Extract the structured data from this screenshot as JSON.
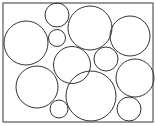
{
  "diagram": {
    "type": "circle-packing",
    "frame": {
      "x": 3,
      "y": 3,
      "width": 150,
      "height": 119,
      "stroke": "#666666"
    },
    "stroke_color": "#333333",
    "fill_color": "#ffffff",
    "circles": [
      {
        "cx": 57,
        "cy": 15,
        "r": 12
      },
      {
        "cx": 26,
        "cy": 43,
        "r": 22
      },
      {
        "cx": 57,
        "cy": 38,
        "r": 8.5
      },
      {
        "cx": 90,
        "cy": 28,
        "r": 22
      },
      {
        "cx": 130,
        "cy": 36,
        "r": 20
      },
      {
        "cx": 72,
        "cy": 65,
        "r": 18.5
      },
      {
        "cx": 106,
        "cy": 59,
        "r": 12
      },
      {
        "cx": 37,
        "cy": 87,
        "r": 21
      },
      {
        "cx": 91,
        "cy": 96,
        "r": 25
      },
      {
        "cx": 135,
        "cy": 78,
        "r": 19
      },
      {
        "cx": 59,
        "cy": 109,
        "r": 9
      },
      {
        "cx": 129,
        "cy": 109,
        "r": 12
      }
    ]
  }
}
